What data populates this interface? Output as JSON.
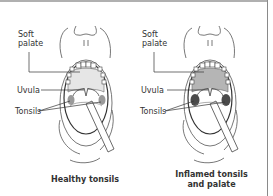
{
  "figure": {
    "panels": [
      {
        "id": "healthy",
        "labels": {
          "soft_palate": "Soft\npalate",
          "uvula": "Uvula",
          "tonsils": "Tonsils"
        },
        "caption": "Healthy tonsils",
        "palate_color": "#e6e6e6",
        "tonsil_color": "#9a9a9a"
      },
      {
        "id": "inflamed",
        "labels": {
          "soft_palate": "Soft\npalate",
          "uvula": "Uvula",
          "tonsils": "Tonsils"
        },
        "caption": "Inflamed tonsils\nand palate",
        "palate_color": "#b5b5b5",
        "tonsil_color": "#4a4a4a"
      }
    ]
  }
}
